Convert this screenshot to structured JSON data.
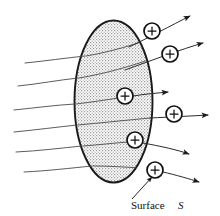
{
  "figure": {
    "type": "physics-diagram",
    "canvas": {
      "width": 220,
      "height": 216,
      "background": "#ffffff"
    },
    "label": {
      "text": "Surface",
      "symbol": "S",
      "x": 133,
      "y": 206,
      "callout_from": [
        131,
        202
      ],
      "callout_to": [
        151,
        176
      ]
    },
    "surface": {
      "name": "gaussian-surface-ellipse",
      "cx": 113.5,
      "cy": 101.5,
      "rx": 39,
      "ry": 81,
      "fill": "#d8d8d8",
      "stroke": "#1a1a1a",
      "stroke_width": 1.9,
      "texture": "stipple"
    },
    "charges": [
      {
        "id": "charge-1",
        "sign": "+",
        "cx": 152,
        "cy": 31,
        "r": 8
      },
      {
        "id": "charge-2",
        "sign": "+",
        "cx": 170,
        "cy": 54,
        "r": 8
      },
      {
        "id": "charge-3",
        "sign": "+",
        "cx": 125,
        "cy": 96,
        "r": 8
      },
      {
        "id": "charge-4",
        "sign": "+",
        "cx": 174,
        "cy": 114,
        "r": 8
      },
      {
        "id": "charge-5",
        "sign": "+",
        "cx": 135,
        "cy": 140,
        "r": 8
      },
      {
        "id": "charge-6",
        "sign": "+",
        "cx": 155,
        "cy": 170,
        "r": 8
      }
    ],
    "incoming_field_lines": [
      {
        "id": "in-1",
        "x1": 25,
        "y1": 63,
        "x2": 85,
        "y2": 56
      },
      {
        "id": "in-2",
        "x1": 18,
        "y1": 86,
        "x2": 78,
        "y2": 78
      },
      {
        "id": "in-3",
        "x1": 14,
        "y1": 110,
        "x2": 75,
        "y2": 104
      },
      {
        "id": "in-4",
        "x1": 14,
        "y1": 132,
        "x2": 77,
        "y2": 125
      },
      {
        "id": "in-5",
        "x1": 16,
        "y1": 152,
        "x2": 82,
        "y2": 146
      },
      {
        "id": "in-6",
        "x1": 24,
        "y1": 172,
        "x2": 92,
        "y2": 166
      }
    ],
    "outgoing_field_lines": [
      {
        "id": "out-1",
        "x1": 105,
        "y1": 49,
        "x2": 192,
        "y2": 15,
        "arrow": true
      },
      {
        "id": "out-2",
        "x1": 96,
        "y1": 79,
        "x2": 205,
        "y2": 42,
        "arrow": true
      },
      {
        "id": "out-3",
        "x1": 103,
        "y1": 98,
        "x2": 170,
        "y2": 91,
        "arrow": true
      },
      {
        "id": "out-4",
        "x1": 105,
        "y1": 117,
        "x2": 210,
        "y2": 114,
        "arrow": true
      },
      {
        "id": "out-5",
        "x1": 110,
        "y1": 142,
        "x2": 190,
        "y2": 153,
        "arrow": true
      },
      {
        "id": "out-6",
        "x1": 113,
        "y1": 166,
        "x2": 200,
        "y2": 182,
        "arrow": true
      }
    ],
    "colors": {
      "surface_fill": "#d8d8d8",
      "outline": "#1a1a1a",
      "field_line": "#4a4a4a",
      "text": "#111111"
    }
  }
}
